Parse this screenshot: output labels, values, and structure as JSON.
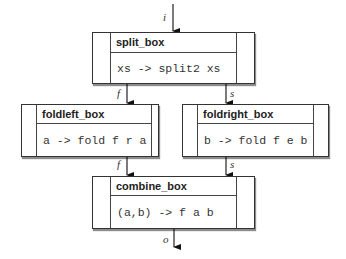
{
  "diagram": {
    "nodes": [
      {
        "id": "split_box",
        "title": "split_box",
        "code": "xs -> split2 xs"
      },
      {
        "id": "foldleft_box",
        "title": "foldleft_box",
        "code": "a -> fold f r a"
      },
      {
        "id": "foldright_box",
        "title": "foldright_box",
        "code": "b -> fold f e b"
      },
      {
        "id": "combine_box",
        "title": "combine_box",
        "code": "(a,b) -> f a b"
      }
    ],
    "edges": [
      {
        "from": "input",
        "to": "split_box",
        "label": "i"
      },
      {
        "from": "split_box",
        "to": "foldleft_box",
        "label": "f"
      },
      {
        "from": "split_box",
        "to": "foldright_box",
        "label": "s"
      },
      {
        "from": "foldleft_box",
        "to": "combine_box",
        "label": "f"
      },
      {
        "from": "foldright_box",
        "to": "combine_box",
        "label": "s"
      },
      {
        "from": "combine_box",
        "to": "output",
        "label": "o"
      }
    ]
  }
}
